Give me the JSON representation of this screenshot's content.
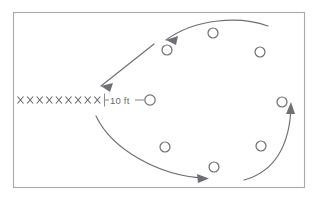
{
  "figure": {
    "background_color": "#ffffff",
    "frame": {
      "name": "figure-border",
      "x": 13,
      "y": 12,
      "width": 292,
      "height": 176,
      "stroke_color": "#a9a9ac"
    },
    "ink_color": "#6e6e74",
    "dimension": {
      "label": "10 ft",
      "tick_left_label": "|",
      "row_marks_text": "x x x x x x x x x",
      "mark_symbol": "x",
      "mark_count": 9,
      "marks_start_x": 20,
      "marks_step": 9.6,
      "marks_y": 100,
      "extension_line_x": 103,
      "label_x": 108,
      "label_y": 103,
      "arrow_stub_from_x": 134,
      "arrow_stub_to_x": 144,
      "terminal_circle": {
        "cx": 150,
        "cy": 100,
        "r": 5.2
      }
    },
    "nodes": [
      {
        "name": "node-top-center",
        "cx": 213,
        "cy": 33,
        "r": 5.0
      },
      {
        "name": "node-upper-left",
        "cx": 167,
        "cy": 50,
        "r": 5.0
      },
      {
        "name": "node-upper-right",
        "cx": 260,
        "cy": 52,
        "r": 5.0
      },
      {
        "name": "node-right-upper",
        "cx": 282,
        "cy": 102,
        "r": 5.0
      },
      {
        "name": "node-right-lower",
        "cx": 261,
        "cy": 146,
        "r": 5.0
      },
      {
        "name": "node-bottom-center",
        "cx": 214,
        "cy": 167,
        "r": 5.0
      },
      {
        "name": "node-lower-left",
        "cx": 165,
        "cy": 147,
        "r": 5.0
      },
      {
        "name": "node-dimension-end",
        "cx": 150,
        "cy": 100,
        "r": 5.2
      }
    ],
    "arrows": [
      {
        "name": "arrow-top-arc",
        "description": "curved arc across the top sweeping right to left",
        "path": "M 268 26 C 240 16 196 18 166 40",
        "head_at": [
          166,
          40
        ],
        "head_angle": 143
      },
      {
        "name": "arrow-diagonal-left",
        "description": "straight diagonal arrow pointing down and to the left",
        "path": "M 154 44 L 101 86",
        "head_at": [
          101,
          86
        ],
        "head_angle": 141
      },
      {
        "name": "arrow-bottom-arc",
        "description": "curved arc from left sweeping down and to the right",
        "path": "M 96 116 C 112 150 160 176 204 178",
        "head_at": [
          207,
          178
        ],
        "head_angle": 5
      },
      {
        "name": "arrow-right-arc",
        "description": "curved arc on the right sweeping up",
        "path": "M 244 180 C 274 172 290 146 291 106",
        "head_at": [
          291,
          103
        ],
        "head_angle": -87
      }
    ]
  }
}
